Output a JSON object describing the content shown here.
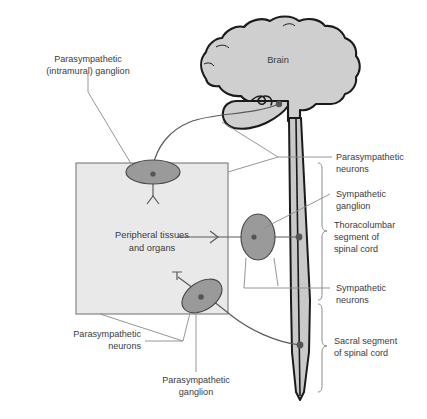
{
  "figure": {
    "type": "anatomical-diagram",
    "background_color": "#ffffff"
  },
  "colors": {
    "brain_fill": "#cfcfcf",
    "brain_outline": "#1a1a1a",
    "cord_fill": "#c9c9c9",
    "cord_outline": "#1a1a1a",
    "box_fill": "#e9e9e9",
    "box_outline": "#6f6f6f",
    "ganglion_fill": "#9a9a9a",
    "ganglion_outline": "#4a4a4a",
    "neuron_dot": "#555555",
    "axon": "#5a5a5a",
    "leader_line": "#8a8a8a",
    "bracket": "#8a8a8a",
    "text": "#3b3b3b"
  },
  "structures": {
    "brain_label": "Brain",
    "peripheral_box_line1": "Peripheral tissues",
    "peripheral_box_line2": "and organs"
  },
  "labels": {
    "parasympathetic_intramural_ganglion": {
      "line1": "Parasympathetic",
      "line2": "(intramural) ganglion"
    },
    "parasympathetic_neurons_right": {
      "line1": "Parasympathetic",
      "line2": "neurons"
    },
    "sympathetic_ganglion": {
      "line1": "Sympathetic",
      "line2": "ganglion"
    },
    "thoracolumbar_segment": {
      "line1": "Thoracolumbar",
      "line2": "segment of",
      "line3": "spinal cord"
    },
    "sympathetic_neurons": {
      "line1": "Sympathetic",
      "line2": "neurons"
    },
    "sacral_segment": {
      "line1": "Sacral segment",
      "line2": "of spinal cord"
    },
    "parasympathetic_neurons_bottom": {
      "line1": "Parasympathetic",
      "line2": "neurons"
    },
    "parasympathetic_ganglion_bottom": {
      "line1": "Parasympathetic",
      "line2": "ganglion"
    }
  }
}
